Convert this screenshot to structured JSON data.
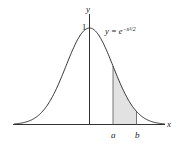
{
  "diagram": {
    "equation_label": "y = e^{-x^2/2}",
    "equation_parts": {
      "lhs": "y = e",
      "exponent": "−x²/2"
    },
    "y_axis_label": "y",
    "x_axis_label": "x",
    "peak_label": "1",
    "bound_a_label": "a",
    "bound_b_label": "b",
    "colors": {
      "curve": "#333333",
      "axis": "#333333",
      "shade": "#e2e2e2",
      "background": "#ffffff"
    }
  },
  "chart_data": {
    "type": "area",
    "title": "",
    "function": "y = e^(-x^2/2)",
    "xlabel": "x",
    "ylabel": "y",
    "annotations": [
      "1",
      "a",
      "b",
      "y = e^(-x^2/2)"
    ],
    "shaded_region": {
      "from": "a",
      "to": "b"
    },
    "peak": {
      "x": 0,
      "y": 1
    },
    "approx_x_range": [
      -3.2,
      3.2
    ],
    "a_approx": 1.0,
    "b_approx": 2.0,
    "grid": false
  }
}
